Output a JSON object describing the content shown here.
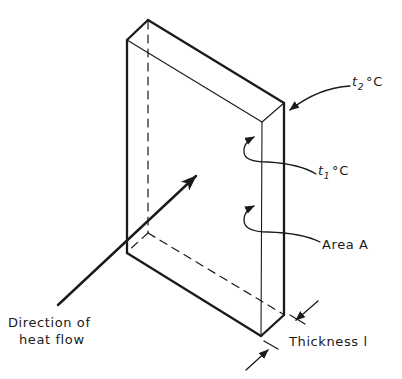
{
  "diagram": {
    "labels": {
      "outer_temp": {
        "symbol": "t",
        "subscript": "2",
        "unit": "°C"
      },
      "inner_temp": {
        "symbol": "t",
        "subscript": "1",
        "unit": "°C"
      },
      "area": "Area A",
      "thickness": "Thickness l",
      "heat_flow_line1": "Direction of",
      "heat_flow_line2": "heat flow"
    },
    "colors": {
      "ink": "#1a1a1a",
      "background": "#ffffff"
    }
  }
}
